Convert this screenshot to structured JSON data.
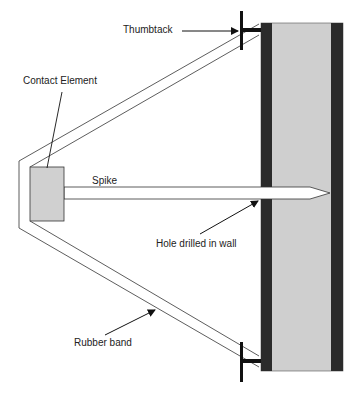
{
  "diagram": {
    "labels": {
      "thumbtack": "Thumbtack",
      "contact_element": "Contact Element",
      "spike": "Spike",
      "hole": "Hole drilled in wall",
      "rubber_band": "Rubber band"
    },
    "colors": {
      "wall_face": "#2b2b2b",
      "wall_core": "#cfcfcf",
      "contact_fill": "#d0d0d0",
      "line": "#333333",
      "tack": "#111111"
    }
  }
}
